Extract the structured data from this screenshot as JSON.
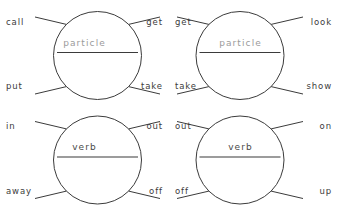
{
  "diagram": {
    "type": "phrasal-verb-collocation-wheels",
    "panel_count": 4,
    "stroke_color": "#3b3b3b",
    "particle_text_color": "#9b9b9b",
    "verb_text_color": "#4a4a4a",
    "background_color": "#ffffff",
    "panels": [
      {
        "id": "panel-particle-call-put",
        "center_label": "particle",
        "center_kind": "particle",
        "top_left": "call",
        "bottom_left": "put",
        "top_right": "get",
        "bottom_right": "take"
      },
      {
        "id": "panel-particle-get-take",
        "center_label": "particle",
        "center_kind": "particle",
        "top_left": "get",
        "bottom_left": "take",
        "top_right": "look",
        "bottom_right": "show"
      },
      {
        "id": "panel-verb-in-away",
        "center_label": "verb",
        "center_kind": "verb",
        "top_left": "in",
        "bottom_left": "away",
        "top_right": "out",
        "bottom_right": "off"
      },
      {
        "id": "panel-verb-out-off",
        "center_label": "verb",
        "center_kind": "verb",
        "top_left": "out",
        "bottom_left": "off",
        "top_right": "on",
        "bottom_right": "up"
      }
    ]
  }
}
